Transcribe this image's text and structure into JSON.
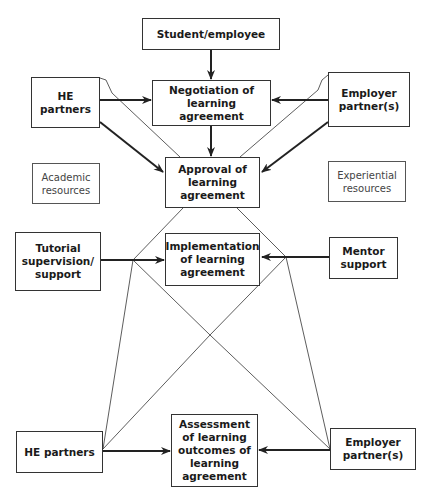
{
  "diagram": {
    "nodes": {
      "student": {
        "label": "Student/employee"
      },
      "negotiation": {
        "label": "Negotiation of learning agreement"
      },
      "he_top": {
        "label": "HE partners"
      },
      "employer_top": {
        "label": "Employer partner(s)"
      },
      "approval": {
        "label": "Approval of learning agreement"
      },
      "academic": {
        "label": "Academic resources"
      },
      "experiential": {
        "label": "Experiential resources"
      },
      "tutorial": {
        "label": "Tutorial supervision/ support"
      },
      "implementation": {
        "label": "Implementation of learning agreement"
      },
      "mentor": {
        "label": "Mentor support"
      },
      "he_bottom": {
        "label": "HE partners"
      },
      "assessment": {
        "label": "Assessment of learning outcomes of learning agreement"
      },
      "employer_bottom": {
        "label": "Employer partner(s)"
      }
    },
    "edges": [
      {
        "from": "student",
        "to": "negotiation",
        "style": "arrow"
      },
      {
        "from": "he_top",
        "to": "negotiation",
        "style": "arrow"
      },
      {
        "from": "employer_top",
        "to": "negotiation",
        "style": "arrow"
      },
      {
        "from": "negotiation",
        "to": "approval",
        "style": "arrow"
      },
      {
        "from": "he_top",
        "to": "approval",
        "style": "arrow"
      },
      {
        "from": "employer_top",
        "to": "approval",
        "style": "arrow"
      },
      {
        "from": "tutorial",
        "to": "implementation",
        "style": "arrow"
      },
      {
        "from": "mentor",
        "to": "implementation",
        "style": "arrow"
      },
      {
        "from": "he_bottom",
        "to": "assessment",
        "style": "arrow"
      },
      {
        "from": "employer_bottom",
        "to": "assessment",
        "style": "arrow"
      },
      {
        "from": "he_top",
        "to": "approval",
        "style": "thin-line"
      },
      {
        "from": "employer_top",
        "to": "approval",
        "style": "thin-line"
      },
      {
        "from": "approval",
        "to": "he_bottom",
        "style": "thin-line-diamond"
      },
      {
        "from": "approval",
        "to": "employer_bottom",
        "style": "thin-line-diamond"
      }
    ]
  }
}
